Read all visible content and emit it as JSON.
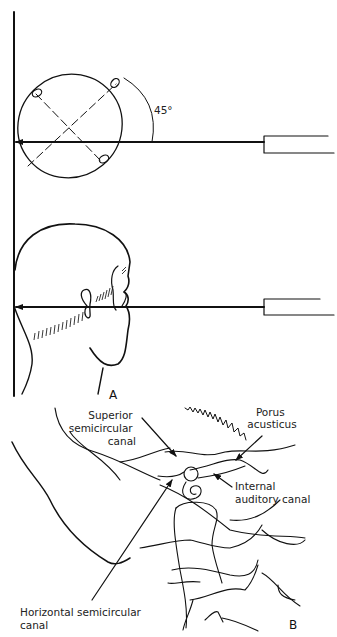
{
  "figure": {
    "panel_a": {
      "label": "A",
      "angle_label": "45°",
      "views": [
        "skull-top-view",
        "head-side-view"
      ]
    },
    "panel_b": {
      "label": "B",
      "annotations": [
        {
          "lines": [
            "Superior",
            "semicircular",
            "canal"
          ]
        },
        {
          "lines": [
            "Porus",
            "acusticus"
          ]
        },
        {
          "lines": [
            "Internal",
            "auditory canal"
          ]
        },
        {
          "lines": [
            "Horizontal semicircular",
            "canal"
          ]
        }
      ]
    },
    "colors": {
      "ink": "#111111",
      "background": "#ffffff"
    }
  }
}
